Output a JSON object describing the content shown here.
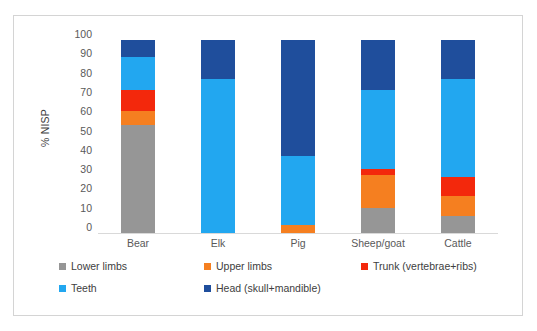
{
  "chart_data": {
    "type": "bar",
    "subtype": "stacked-100-percent-column",
    "title": "",
    "xlabel": "",
    "ylabel": "% NISP",
    "ylim": [
      0,
      100
    ],
    "ytick_step": 10,
    "yticks": [
      100,
      90,
      80,
      70,
      60,
      50,
      40,
      30,
      20,
      10,
      0
    ],
    "grid": false,
    "legend_position": "bottom",
    "categories": [
      "Bear",
      "Elk",
      "Pig",
      "Sheep/goat",
      "Cattle"
    ],
    "series": [
      {
        "name": "Lower limbs",
        "color": "#969696",
        "values": [
          56,
          0,
          0,
          13,
          9
        ]
      },
      {
        "name": "Upper limbs",
        "color": "#F57F20",
        "values": [
          7,
          0,
          4,
          17,
          10
        ]
      },
      {
        "name": "Trunk (vertebrae+ribs)",
        "color": "#F3280C",
        "values": [
          11,
          0,
          0,
          3,
          10
        ]
      },
      {
        "name": "Teeth",
        "color": "#22A7F0",
        "values": [
          17,
          80,
          36,
          41,
          51
        ]
      },
      {
        "name": "Head (skull+mandible)",
        "color": "#1F4E9C",
        "values": [
          9,
          20,
          60,
          26,
          20
        ]
      }
    ]
  },
  "axis": {
    "y_title": "% NISP",
    "y_labels": [
      "100",
      "90",
      "80",
      "70",
      "60",
      "50",
      "40",
      "30",
      "20",
      "10",
      "0"
    ],
    "x_labels": [
      "Bear",
      "Elk",
      "Pig",
      "Sheep/goat",
      "Cattle"
    ]
  },
  "legend": {
    "items": [
      {
        "label": "Lower limbs",
        "color": "#969696"
      },
      {
        "label": "Upper limbs",
        "color": "#F57F20"
      },
      {
        "label": "Trunk (vertebrae+ribs)",
        "color": "#F3280C"
      },
      {
        "label": "Teeth",
        "color": "#22A7F0"
      },
      {
        "label": "Head (skull+mandible)",
        "color": "#1F4E9C"
      }
    ]
  },
  "colors": {
    "frame_border": "#d4d4d4",
    "axis_line": "#d9d9d9",
    "tick_text": "#595959",
    "legend_text": "#404040",
    "background": "#ffffff"
  }
}
